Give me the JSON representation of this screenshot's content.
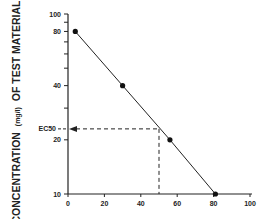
{
  "chart_data": {
    "type": "line",
    "title": "",
    "xlabel": "",
    "ylabel": "CONCENTRATION (mg/l) OF TEST MATERIAL",
    "ylabel_main_left": "CONCENTRATION",
    "ylabel_unit": "(mg/l)",
    "ylabel_main_right": "OF TEST MATERIAL",
    "y_scale": "log",
    "xlim": [
      0,
      100
    ],
    "ylim": [
      10,
      100
    ],
    "x_ticks": [
      "0",
      "20",
      "40",
      "60",
      "80",
      "100"
    ],
    "y_ticks": [
      "10",
      "20",
      "40",
      "80",
      "100"
    ],
    "series": [
      {
        "name": "concentration-response",
        "x": [
          4,
          30,
          56,
          81
        ],
        "y": [
          80,
          40,
          20,
          10
        ]
      }
    ],
    "annotations": [
      {
        "label": "EC50",
        "x": 50,
        "y": 23
      }
    ],
    "grid": false,
    "legend": null
  }
}
